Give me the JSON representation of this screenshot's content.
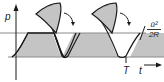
{
  "diagram": {
    "type": "pressure-time waveform with clipped peaks redistributed",
    "y_axis_label": "p",
    "threshold_label": {
      "numerator": "ū²",
      "denominator": "2R"
    },
    "period_label": "T",
    "time_label": "t",
    "colors": {
      "fill": "#c4c4c4",
      "stroke": "#1a1a1a",
      "guide_line": "#8a8a8a"
    },
    "elements": [
      "vertical p axis with arrow",
      "horizontal threshold line at ū²/2R",
      "baseline",
      "periodic waveform clipped at threshold (gray filled)",
      "two cut-off peaks drawn as gray petal shapes above the threshold",
      "two curved arrows indicating redistribution",
      "time arrow"
    ]
  }
}
